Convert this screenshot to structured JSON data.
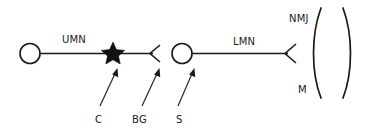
{
  "figure": {
    "background_color": "#ffffff",
    "ink_color": "#1a1a1a"
  },
  "labels": {
    "upper_motor_neuron": "UMN",
    "lower_motor_neuron": "LMN",
    "neuromuscular_junction": "NMJ",
    "muscle": "M",
    "cortex_marker": "C",
    "basal_ganglia_marker": "BG",
    "spinal_cord_marker": "S"
  },
  "structures": {
    "upper_soma": "upper-motor-neuron-cell-body",
    "lower_soma": "lower-motor-neuron-cell-body",
    "star": "lesion-star-marker",
    "upper_terminal": "upper-motor-neuron-axon-terminal",
    "lower_terminal": "lower-motor-neuron-axon-terminal",
    "muscle_shape": "muscle-lens"
  },
  "annotations": [
    {
      "label": "C",
      "points_to": "lesion-star-marker"
    },
    {
      "label": "BG",
      "points_to": "upper-motor-neuron-axon-terminal"
    },
    {
      "label": "S",
      "points_to": "lower-motor-neuron-cell-body"
    }
  ]
}
